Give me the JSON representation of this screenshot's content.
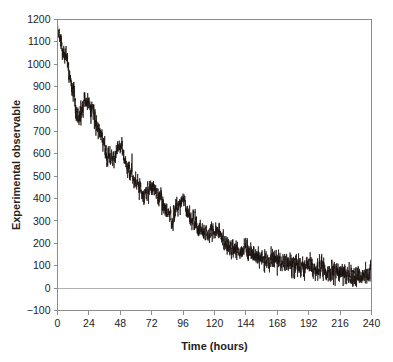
{
  "chart_data": {
    "type": "line",
    "title": "",
    "xlabel": "Time (hours)",
    "ylabel": "Experimental observable",
    "xlim": [
      0,
      240
    ],
    "ylim": [
      -100,
      1200
    ],
    "xticks": [
      0,
      24,
      48,
      72,
      96,
      120,
      144,
      168,
      192,
      216,
      240
    ],
    "xtick_labels": [
      "0",
      "24",
      "48",
      "72",
      "96",
      "120",
      "144",
      "168",
      "192",
      "216",
      "240"
    ],
    "yticks": [
      -100,
      0,
      100,
      200,
      300,
      400,
      500,
      600,
      700,
      800,
      900,
      1000,
      1100,
      1200
    ],
    "ytick_labels": [
      "−100",
      "0",
      "100",
      "200",
      "300",
      "400",
      "500",
      "600",
      "700",
      "800",
      "900",
      "1000",
      "1100",
      "1200"
    ],
    "grid": false,
    "legend": false,
    "zero_reference_line": 0,
    "trace_color": "#1a1210",
    "axis_color": "#8d8d8d",
    "zero_line_color": "#b0b0b0",
    "series": [
      {
        "name": "Experimental observable",
        "model": {
          "baseline_start": 1150,
          "decay_floor": 40,
          "oscillation_period_hours": 24,
          "oscillation_initial_amplitude": 95,
          "noise_initial_sigma": 18,
          "noise_final_sigma": 26
        },
        "anchor_points": [
          {
            "x": 0,
            "y": 1150
          },
          {
            "x": 6,
            "y": 1040
          },
          {
            "x": 12,
            "y": 880
          },
          {
            "x": 15,
            "y": 760
          },
          {
            "x": 18,
            "y": 790
          },
          {
            "x": 22,
            "y": 835
          },
          {
            "x": 26,
            "y": 800
          },
          {
            "x": 32,
            "y": 700
          },
          {
            "x": 38,
            "y": 590
          },
          {
            "x": 42,
            "y": 575
          },
          {
            "x": 46,
            "y": 620
          },
          {
            "x": 48,
            "y": 640
          },
          {
            "x": 54,
            "y": 540
          },
          {
            "x": 60,
            "y": 470
          },
          {
            "x": 66,
            "y": 420
          },
          {
            "x": 70,
            "y": 440
          },
          {
            "x": 73,
            "y": 455
          },
          {
            "x": 78,
            "y": 400
          },
          {
            "x": 84,
            "y": 340
          },
          {
            "x": 88,
            "y": 315
          },
          {
            "x": 93,
            "y": 375
          },
          {
            "x": 96,
            "y": 385
          },
          {
            "x": 102,
            "y": 310
          },
          {
            "x": 108,
            "y": 265
          },
          {
            "x": 114,
            "y": 235
          },
          {
            "x": 118,
            "y": 250
          },
          {
            "x": 122,
            "y": 245
          },
          {
            "x": 128,
            "y": 200
          },
          {
            "x": 134,
            "y": 175
          },
          {
            "x": 140,
            "y": 165
          },
          {
            "x": 144,
            "y": 178
          },
          {
            "x": 150,
            "y": 150
          },
          {
            "x": 156,
            "y": 135
          },
          {
            "x": 162,
            "y": 125
          },
          {
            "x": 168,
            "y": 130
          },
          {
            "x": 174,
            "y": 110
          },
          {
            "x": 180,
            "y": 100
          },
          {
            "x": 186,
            "y": 98
          },
          {
            "x": 192,
            "y": 105
          },
          {
            "x": 198,
            "y": 90
          },
          {
            "x": 204,
            "y": 80
          },
          {
            "x": 210,
            "y": 72
          },
          {
            "x": 216,
            "y": 75
          },
          {
            "x": 222,
            "y": 62
          },
          {
            "x": 228,
            "y": 55
          },
          {
            "x": 234,
            "y": 52
          },
          {
            "x": 240,
            "y": 58
          }
        ]
      }
    ]
  }
}
